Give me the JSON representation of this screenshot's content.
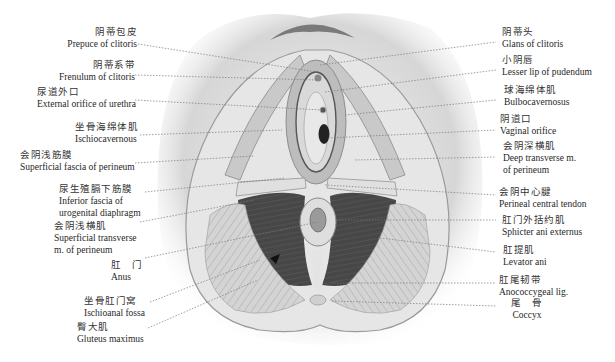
{
  "figure": {
    "colors": {
      "background": "#ffffff",
      "skin": "#d8d8d8",
      "muscle_dark": "#4a4a4a",
      "muscle_light": "#cfcfcf",
      "leader_line": "#777777",
      "text": "#1f1f1f"
    }
  },
  "labels_left": [
    {
      "zh": "阴蒂包皮",
      "en": "Prepuce of clitoris"
    },
    {
      "zh": "阴蒂系带",
      "en": "Frenulum of clitoris"
    },
    {
      "zh": "尿道外口",
      "en": "External orifice of urethra"
    },
    {
      "zh": "坐骨海绵体肌",
      "en": "Ischiocavernous"
    },
    {
      "zh": "会阴浅筋膜",
      "en": "Superficial fascia of perineum"
    },
    {
      "zh": "尿生殖膈下筋膜",
      "en": "Inferior fascia of",
      "en2": "urogenital diaphragm"
    },
    {
      "zh": "会阴浅横肌",
      "en": "Superficial transverse",
      "en2": "m. of perineum"
    },
    {
      "zh": "肛　门",
      "en": "Anus"
    },
    {
      "zh": "坐骨肛门窝",
      "en": "Ischioanal fossa"
    },
    {
      "zh": "臀大肌",
      "en": "Gluteus maximus"
    }
  ],
  "labels_right": [
    {
      "zh": "阴蒂头",
      "en": "Glans of clitoris"
    },
    {
      "zh": "小阴唇",
      "en": "Lesser lip of pudendum"
    },
    {
      "zh": "球海绵体肌",
      "en": "Bulbocavernosus"
    },
    {
      "zh": "阴道口",
      "en": "Vaginal orifice"
    },
    {
      "zh": "会阴深横肌",
      "en": "Deep transverse m.",
      "en2": "of perineum"
    },
    {
      "zh": "会阴中心腱",
      "en": "Perineal central tendon"
    },
    {
      "zh": "肛门外括约肌",
      "en": "Sphicter ani externus"
    },
    {
      "zh": "肛提肌",
      "en": "Levator ani"
    },
    {
      "zh": "肛尾韧带",
      "en": "Anococcygeal lig."
    },
    {
      "zh": "尾　骨",
      "en": "Coccyx"
    }
  ]
}
